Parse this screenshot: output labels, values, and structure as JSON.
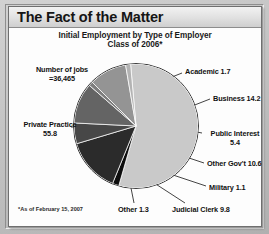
{
  "window": {
    "title": "The Fact of the Matter"
  },
  "chart_data": {
    "type": "pie",
    "title": "The Fact of the Matter",
    "subtitle_line1": "Initial Employment by Type of Employer",
    "subtitle_line2": "Class of 2006*",
    "footnote": "*As of February 15, 2007",
    "annotation_line1": "Number of jobs",
    "annotation_line2": "=36,465",
    "total_jobs": "36,465",
    "unit": "percent",
    "legend": "none",
    "grid": false,
    "categories": [
      "Private Practice",
      "Academic",
      "Business",
      "Public Interest",
      "Other Gov't",
      "Military",
      "Judicial Clerk",
      "Other"
    ],
    "values": [
      55.8,
      1.7,
      14.2,
      5.4,
      10.6,
      1.1,
      9.8,
      1.3
    ],
    "slices": [
      {
        "label": "Private Practice",
        "value": "55.8",
        "color": "#c9c9c9"
      },
      {
        "label": "Academic",
        "value": "1.7",
        "color": "#0d0d0d"
      },
      {
        "label": "Business",
        "value": "14.2",
        "color": "#2b2b2b"
      },
      {
        "label": "Public Interest",
        "value": "5.4",
        "color": "#474747"
      },
      {
        "label": "Other Gov't",
        "value": "10.6",
        "color": "#646464"
      },
      {
        "label": "Military",
        "value": "1.1",
        "color": "#7d7d7d"
      },
      {
        "label": "Judicial Clerk",
        "value": "9.8",
        "color": "#949494"
      },
      {
        "label": "Other",
        "value": "1.3",
        "color": "#b3b3b3"
      }
    ]
  },
  "labels": {
    "jobs_l1": "Number of jobs",
    "jobs_l2": "=36,465",
    "private_l1": "Private Practice",
    "private_l2": "55.8",
    "academic": "Academic 1.7",
    "business": "Business 14.2",
    "public_interest_l1": "Public Interest",
    "public_interest_l2": "5.4",
    "other_gov": "Other Gov't 10.6",
    "military": "Military 1.1",
    "judicial": "Judicial Clerk 9.8",
    "other": "Other 1.3"
  }
}
